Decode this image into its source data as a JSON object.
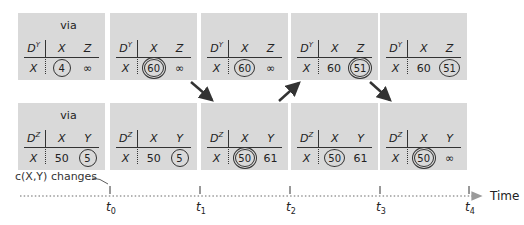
{
  "top_row": {
    "table_label_base": "D",
    "table_label_sup": "Y",
    "via_label": "via",
    "row_label": "X",
    "col_headers": [
      "X",
      "Z"
    ],
    "panels": [
      {
        "id": "t0",
        "show_via": true,
        "x_val": "4",
        "x_style": "circle",
        "z_val": "∞",
        "z_style": "plain"
      },
      {
        "id": "t1",
        "show_via": false,
        "x_val": "60",
        "x_style": "double",
        "z_val": "∞",
        "z_style": "plain"
      },
      {
        "id": "t2",
        "show_via": false,
        "x_val": "60",
        "x_style": "circle",
        "z_val": "∞",
        "z_style": "plain"
      },
      {
        "id": "t3",
        "show_via": false,
        "x_val": "60",
        "x_style": "plain",
        "z_val": "51",
        "z_style": "double"
      },
      {
        "id": "t4",
        "show_via": false,
        "x_val": "60",
        "x_style": "plain",
        "z_val": "51",
        "z_style": "circle"
      }
    ]
  },
  "bottom_row": {
    "table_label_base": "D",
    "table_label_sup": "Z",
    "via_label": "via",
    "row_label": "X",
    "col_headers": [
      "X",
      "Y"
    ],
    "panels": [
      {
        "id": "t0",
        "show_via": true,
        "x_val": "50",
        "x_style": "plain",
        "y_val": "5",
        "y_style": "circle"
      },
      {
        "id": "t1",
        "show_via": false,
        "x_val": "50",
        "x_style": "plain",
        "y_val": "5",
        "y_style": "circle"
      },
      {
        "id": "t2",
        "show_via": false,
        "x_val": "50",
        "x_style": "double",
        "y_val": "61",
        "y_style": "plain"
      },
      {
        "id": "t3",
        "show_via": false,
        "x_val": "50",
        "x_style": "circle",
        "y_val": "61",
        "y_style": "plain"
      },
      {
        "id": "t4",
        "show_via": false,
        "x_val": "50",
        "x_style": "double",
        "y_val": "∞",
        "y_style": "plain"
      }
    ]
  },
  "arrows": [
    {
      "from": "top-t1",
      "to": "bottom-t2",
      "direction": "down-right"
    },
    {
      "from": "bottom-t2",
      "to": "top-t3",
      "direction": "up-right"
    },
    {
      "from": "top-t3",
      "to": "bottom-t4",
      "direction": "down-right"
    }
  ],
  "timeline": {
    "event_label": "c(X,Y) changes",
    "axis_label": "Time",
    "ticks": [
      {
        "base": "t",
        "sub": "0"
      },
      {
        "base": "t",
        "sub": "1"
      },
      {
        "base": "t",
        "sub": "2"
      },
      {
        "base": "t",
        "sub": "3"
      },
      {
        "base": "t",
        "sub": "4"
      }
    ]
  },
  "colors": {
    "panel_bg": "#d9d9d9",
    "arrow": "#333333",
    "timeline_dots": "#9a9a9a"
  }
}
